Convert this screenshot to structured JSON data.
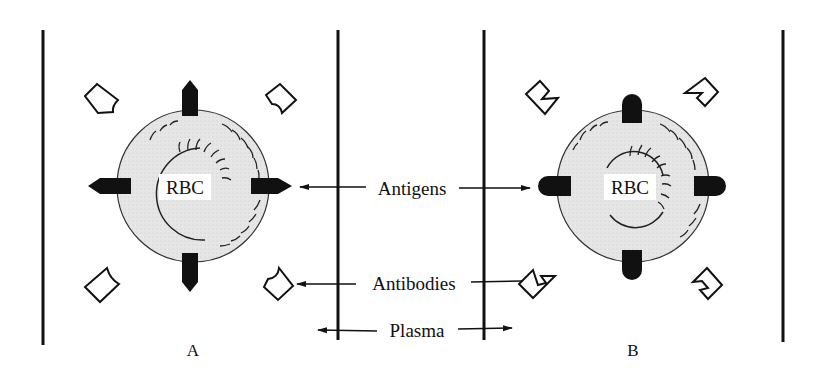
{
  "labels": {
    "antigens": "Antigens",
    "antibodies": "Antibodies",
    "plasma": "Plasma",
    "cell_a": "RBC",
    "cell_b": "RBC",
    "panel_a": "A",
    "panel_b": "B"
  },
  "colors": {
    "ink": "#111111",
    "cell_fill": "#e3e3e3",
    "background": "#ffffff"
  }
}
